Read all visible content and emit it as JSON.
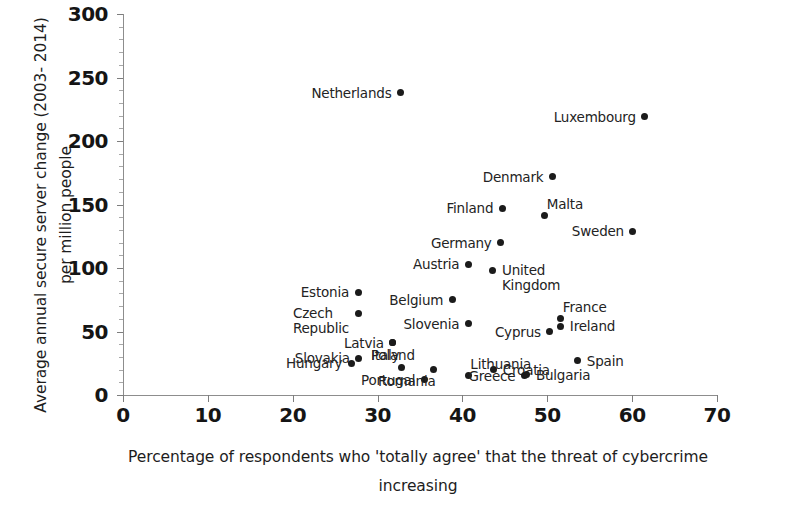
{
  "chart_data": {
    "type": "scatter",
    "title": "",
    "xlabel": "Percentage of respondents who 'totally agree' that the threat of cybercrime increasing",
    "ylabel": "Average annual secure server change (2003-2014) per million people",
    "xlim": [
      0,
      70
    ],
    "ylim": [
      0,
      300
    ],
    "xticks": [
      0,
      10,
      20,
      30,
      40,
      50,
      60,
      70
    ],
    "yticks": [
      0,
      50,
      100,
      150,
      200,
      250,
      300
    ],
    "grid": false,
    "legend": "none",
    "marker_color": "#1b1b1b",
    "axis_color": "#8d8d8d",
    "points": [
      {
        "label": "Netherlands",
        "x": 32.7,
        "y": 238,
        "label_pos": "left"
      },
      {
        "label": "Luxembourg",
        "x": 61.5,
        "y": 219,
        "label_pos": "left"
      },
      {
        "label": "Denmark",
        "x": 50.6,
        "y": 172,
        "label_pos": "left"
      },
      {
        "label": "Malta",
        "x": 49.7,
        "y": 141,
        "label_pos": "above-right"
      },
      {
        "label": "Finland",
        "x": 44.7,
        "y": 147,
        "label_pos": "left"
      },
      {
        "label": "Sweden",
        "x": 60.1,
        "y": 129,
        "label_pos": "left"
      },
      {
        "label": "Germany",
        "x": 44.5,
        "y": 120,
        "label_pos": "left"
      },
      {
        "label": "Austria",
        "x": 40.7,
        "y": 103,
        "label_pos": "left"
      },
      {
        "label": "United\nKingdom",
        "x": 43.6,
        "y": 98,
        "label_pos": "right-stack"
      },
      {
        "label": "Estonia",
        "x": 27.7,
        "y": 81,
        "label_pos": "left"
      },
      {
        "label": "Belgium",
        "x": 38.8,
        "y": 75,
        "label_pos": "left"
      },
      {
        "label": "Czech\nRepublic",
        "x": 27.7,
        "y": 64,
        "label_pos": "left-stack"
      },
      {
        "label": "Slovenia",
        "x": 40.7,
        "y": 56,
        "label_pos": "left"
      },
      {
        "label": "France",
        "x": 51.6,
        "y": 60,
        "label_pos": "above-right"
      },
      {
        "label": "Ireland",
        "x": 51.6,
        "y": 54,
        "label_pos": "right"
      },
      {
        "label": "Cyprus",
        "x": 50.3,
        "y": 50,
        "label_pos": "left"
      },
      {
        "label": "Poland",
        "x": 31.8,
        "y": 41,
        "label_pos": "center-below"
      },
      {
        "label": "Latvia",
        "x": 31.8,
        "y": 41,
        "label_pos": "left"
      },
      {
        "label": "Slovakia",
        "x": 27.8,
        "y": 29,
        "label_pos": "left"
      },
      {
        "label": "Hungary",
        "x": 26.9,
        "y": 25,
        "label_pos": "left"
      },
      {
        "label": "Italy",
        "x": 32.8,
        "y": 22,
        "label_pos": "above-left"
      },
      {
        "label": "Spain",
        "x": 53.6,
        "y": 27,
        "label_pos": "right"
      },
      {
        "label": "Croatia",
        "x": 43.7,
        "y": 20,
        "label_pos": "right"
      },
      {
        "label": "Portugal",
        "x": 35.5,
        "y": 12,
        "label_pos": "left"
      },
      {
        "label": "Romania",
        "x": 36.6,
        "y": 20,
        "label_pos": "below-left"
      },
      {
        "label": "Lithuania",
        "x": 40.7,
        "y": 15,
        "label_pos": "above-right"
      },
      {
        "label": "Greece",
        "x": 47.3,
        "y": 15,
        "label_pos": "left"
      },
      {
        "label": "Bulgaria",
        "x": 47.6,
        "y": 16,
        "label_pos": "right"
      }
    ]
  },
  "axes": {
    "x_tick_labels": [
      "0",
      "10",
      "20",
      "30",
      "40",
      "50",
      "60",
      "70"
    ],
    "y_tick_labels": [
      "0",
      "50",
      "100",
      "150",
      "200",
      "250",
      "300"
    ],
    "x_title": "Percentage of respondents who 'totally agree' that the threat of\ncybercrime increasing",
    "y_title": "Average annual secure server change (2003-\n2014) per million people"
  }
}
